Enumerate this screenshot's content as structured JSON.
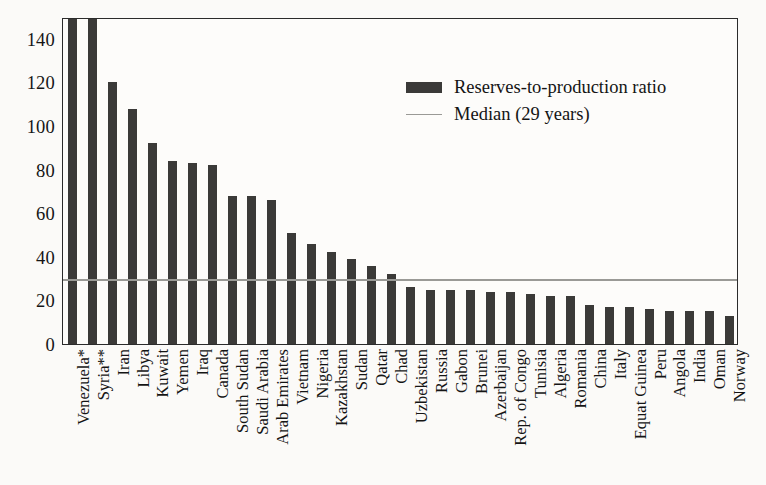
{
  "chart_data": {
    "type": "bar",
    "title": "",
    "xlabel": "",
    "ylabel": "",
    "ylim": [
      0,
      150
    ],
    "yticks": [
      0,
      20,
      40,
      60,
      80,
      100,
      120,
      140
    ],
    "grid": false,
    "legend_position": "inside-top-right",
    "categories": [
      "Venezuela*",
      "Syria**",
      "Iran",
      "Libya",
      "Kuwait",
      "Yemen",
      "Iraq",
      "Canada",
      "South Sudan",
      "Saudi Arabia",
      "Arab Emirates",
      "Vietnam",
      "Nigeria",
      "Kazakhstan",
      "Sudan",
      "Qatar",
      "Chad",
      "Uzbekistan",
      "Russia",
      "Gabon",
      "Brunei",
      "Azerbaijan",
      "Rep. of Congo",
      "Tunisia",
      "Algeria",
      "Romania",
      "China",
      "Italy",
      "Equat Guinea",
      "Peru",
      "Angola",
      "India",
      "Oman",
      "Norway"
    ],
    "values": [
      157,
      155,
      120,
      108,
      92,
      84,
      83,
      82,
      68,
      68,
      66,
      51,
      46,
      42,
      39,
      36,
      32,
      26,
      25,
      25,
      25,
      24,
      24,
      23,
      22,
      22,
      18,
      17,
      17,
      16,
      15,
      15,
      15,
      13
    ],
    "series": [
      {
        "name": "Reserves-to-production ratio",
        "color": "#3b3a38",
        "values": [
          157,
          155,
          120,
          108,
          92,
          84,
          83,
          82,
          68,
          68,
          66,
          51,
          46,
          42,
          39,
          36,
          32,
          26,
          25,
          25,
          25,
          24,
          24,
          23,
          22,
          22,
          18,
          17,
          17,
          16,
          15,
          15,
          15,
          13
        ]
      }
    ],
    "reference_lines": [
      {
        "name": "Median (29 years)",
        "value": 29,
        "color": "#9a9a96",
        "orientation": "horizontal"
      }
    ]
  },
  "legend": {
    "items": [
      {
        "label": "Reserves-to-production ratio",
        "key": "bar-swatch"
      },
      {
        "label": "Median (29 years)",
        "key": "line-swatch"
      }
    ]
  },
  "axis": {
    "y_tick_labels": [
      "140",
      "120",
      "100",
      "80",
      "60",
      "40",
      "20",
      "0"
    ]
  }
}
